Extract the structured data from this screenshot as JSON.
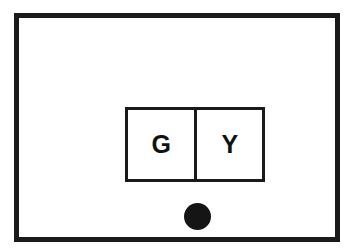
{
  "figure": {
    "background_color": "#ffffff",
    "stroke_color": "#1a1a1a",
    "outer_frame": {
      "label": "outer-frame",
      "x": 14,
      "y": 13,
      "width": 326,
      "height": 229,
      "border_width": 5
    },
    "inner_box": {
      "label": "inner-box",
      "x": 106,
      "y": 89,
      "width": 140,
      "height": 75,
      "border_width": 3,
      "divider_x": 180,
      "cells": [
        {
          "id": "left",
          "letter": "G",
          "width": 71
        },
        {
          "id": "right",
          "letter": "Y",
          "width": 66
        }
      ]
    },
    "marker_dot": {
      "label": "marker-dot",
      "shape": "filled-circle",
      "center_x": 178,
      "center_y": 198,
      "diameter": 27,
      "fill": "#151515"
    }
  }
}
